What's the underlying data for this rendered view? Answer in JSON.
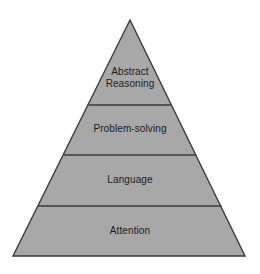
{
  "diagram": {
    "type": "pyramid",
    "title": "",
    "background_color": "#ffffff",
    "fill_color": "#a8a8a8",
    "stroke_color": "#3a3a3a",
    "text_color": "#1c1c1c",
    "apex": {
      "x": 130,
      "y": 20
    },
    "base_left": {
      "x": 13,
      "y": 256
    },
    "base_right": {
      "x": 245,
      "y": 256
    },
    "divider_y": [
      105,
      155,
      206
    ],
    "tiers": [
      {
        "label": "Abstract\nReasoning",
        "label_flat": "Abstract Reasoning",
        "level": 1,
        "position": "top"
      },
      {
        "label": "Problem-solving",
        "label_flat": "Problem-solving",
        "level": 2,
        "position": "upper-middle"
      },
      {
        "label": "Language",
        "label_flat": "Language",
        "level": 3,
        "position": "lower-middle"
      },
      {
        "label": "Attention",
        "label_flat": "Attention",
        "level": 4,
        "position": "base"
      }
    ]
  }
}
